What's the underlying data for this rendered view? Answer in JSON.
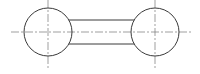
{
  "diagram": {
    "type": "technical-drawing",
    "colors": {
      "outline": "#3a3a3a",
      "centerline": "#777777",
      "background": "#ffffff"
    },
    "left_circle": {
      "cx": 48,
      "cy": 32,
      "r": 24
    },
    "right_circle": {
      "cx": 155,
      "cy": 32,
      "r": 24
    },
    "bar": {
      "x1": 70,
      "x2": 133,
      "top": 20,
      "bottom": 44
    },
    "centerlines": {
      "horizontal": {
        "x1": 11,
        "x2": 191,
        "y": 32
      },
      "left_vertical": {
        "x": 48,
        "y1": 0,
        "y2": 70
      },
      "right_vertical": {
        "x": 155,
        "y1": 0,
        "y2": 70
      }
    }
  }
}
